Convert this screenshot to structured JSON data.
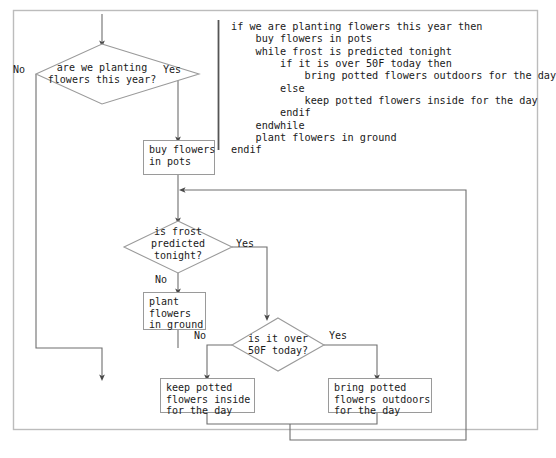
{
  "diagram": {
    "type": "flowchart",
    "title_visible": false,
    "frame": {
      "border_color": "#bcbcbc",
      "background": "#ffffff"
    },
    "line_color": "#6e6e6e",
    "shape_border_color": "#9a9a9a",
    "pseudocode": {
      "divider_color": "#555555",
      "lines": [
        "if we are planting flowers this year then",
        "    buy flowers in pots",
        "    while frost is predicted tonight",
        "        if it is over 50F today then",
        "            bring potted flowers outdoors for the day",
        "        else",
        "            keep potted flowers inside for the day",
        "        endif",
        "    endwhile",
        "    plant flowers in ground",
        "endif"
      ]
    },
    "nodes": [
      {
        "id": "d1",
        "shape": "decision",
        "text": "are we planting\nflowers this year?"
      },
      {
        "id": "p1",
        "shape": "process",
        "text": "buy flowers\nin pots"
      },
      {
        "id": "d2",
        "shape": "decision",
        "text": "is frost\npredicted\ntonight?"
      },
      {
        "id": "p2",
        "shape": "process",
        "text": "plant\nflowers\nin ground"
      },
      {
        "id": "d3",
        "shape": "decision",
        "text": "is it over\n50F today?"
      },
      {
        "id": "p3",
        "shape": "process",
        "text": "keep potted\nflowers inside\nfor the day"
      },
      {
        "id": "p4",
        "shape": "process",
        "text": "bring potted\nflowers outdoors\nfor the day"
      }
    ],
    "edge_labels": {
      "d1_no": "No",
      "d1_yes": "Yes",
      "d2_no": "No",
      "d2_yes": "Yes",
      "d3_no": "No",
      "d3_yes": "Yes"
    }
  }
}
